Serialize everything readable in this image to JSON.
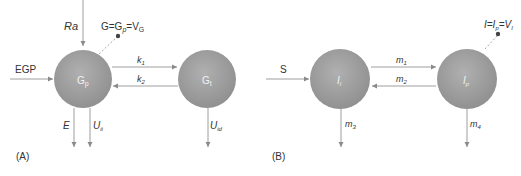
{
  "diagram": {
    "type": "compartment-model",
    "colors": {
      "compartment_fill": "#9a9a9a",
      "arrow": "#9e9e9e",
      "dashed": "#a8a8a8",
      "dot": "#555555",
      "text": "#333333"
    },
    "panel_a": {
      "label": "(A)",
      "compartments": [
        {
          "id": "Gp",
          "main": "G",
          "sub": "p"
        },
        {
          "id": "Gt",
          "main": "G",
          "sub": "t"
        }
      ],
      "observation": {
        "text_main": "G=G",
        "text_sub1": "p",
        "text_mid": "=V",
        "text_sub2": "G"
      },
      "inputs": [
        {
          "label": "Ra",
          "target": "Gp"
        },
        {
          "label": "EGP",
          "target": "Gp"
        }
      ],
      "exchange": [
        {
          "label_main": "k",
          "label_sub": "1",
          "from": "Gp",
          "to": "Gt"
        },
        {
          "label_main": "k",
          "label_sub": "2",
          "from": "Gt",
          "to": "Gp"
        }
      ],
      "outputs": [
        {
          "label_main": "E",
          "label_sub": "",
          "source": "Gp"
        },
        {
          "label_main": "U",
          "label_sub": "ii",
          "source": "Gp"
        },
        {
          "label_main": "U",
          "label_sub": "id",
          "source": "Gt"
        }
      ]
    },
    "panel_b": {
      "label": "(B)",
      "compartments": [
        {
          "id": "Il",
          "main": "I",
          "sub": "l"
        },
        {
          "id": "Ip",
          "main": "I",
          "sub": "p"
        }
      ],
      "observation": {
        "text_main": "I=I",
        "text_sub1": "p",
        "text_mid": "=V",
        "text_sub2": "I"
      },
      "inputs": [
        {
          "label": "S",
          "target": "Il"
        }
      ],
      "exchange": [
        {
          "label_main": "m",
          "label_sub": "1",
          "from": "Il",
          "to": "Ip"
        },
        {
          "label_main": "m",
          "label_sub": "2",
          "from": "Ip",
          "to": "Il"
        }
      ],
      "outputs": [
        {
          "label_main": "m",
          "label_sub": "3",
          "source": "Il"
        },
        {
          "label_main": "m",
          "label_sub": "4",
          "source": "Ip"
        }
      ]
    }
  }
}
